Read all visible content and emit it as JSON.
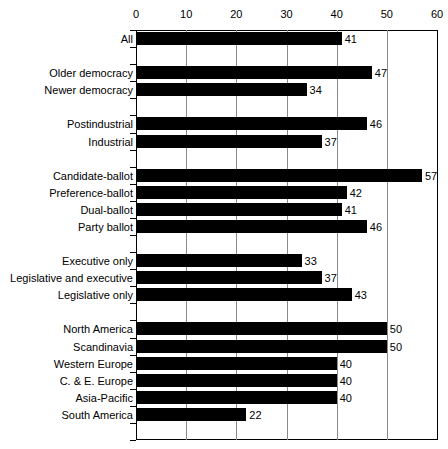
{
  "chart_data": {
    "type": "bar",
    "orientation": "horizontal",
    "title": "",
    "xlabel": "",
    "ylabel": "",
    "xlim": [
      0,
      60
    ],
    "xticks": [
      0,
      10,
      20,
      30,
      40,
      50,
      60
    ],
    "grid": true,
    "legend": false,
    "categories": [
      "All",
      "Older democracy",
      "Newer democracy",
      "Postindustrial",
      "Industrial",
      "Candidate-ballot",
      "Preference-ballot",
      "Dual-ballot",
      "Party ballot",
      "Executive only",
      "Legislative and executive",
      "Legislative only",
      "North America",
      "Scandinavia",
      "Western Europe",
      "C. & E. Europe",
      "Asia-Pacific",
      "South America"
    ],
    "values": [
      41,
      47,
      34,
      46,
      37,
      57,
      42,
      41,
      46,
      33,
      37,
      43,
      50,
      50,
      40,
      40,
      40,
      22
    ],
    "rows": [
      {
        "slot": 0,
        "label": "All",
        "value": 41
      },
      {
        "slot": 2,
        "label": "Older democracy",
        "value": 47
      },
      {
        "slot": 3,
        "label": "Newer democracy",
        "value": 34
      },
      {
        "slot": 5,
        "label": "Postindustrial",
        "value": 46
      },
      {
        "slot": 6,
        "label": "Industrial",
        "value": 37
      },
      {
        "slot": 8,
        "label": "Candidate-ballot",
        "value": 57
      },
      {
        "slot": 9,
        "label": "Preference-ballot",
        "value": 42
      },
      {
        "slot": 10,
        "label": "Dual-ballot",
        "value": 41
      },
      {
        "slot": 11,
        "label": "Party ballot",
        "value": 46
      },
      {
        "slot": 13,
        "label": "Executive only",
        "value": 33
      },
      {
        "slot": 14,
        "label": "Legislative and executive",
        "value": 37
      },
      {
        "slot": 15,
        "label": "Legislative only",
        "value": 43
      },
      {
        "slot": 17,
        "label": "North America",
        "value": 50
      },
      {
        "slot": 18,
        "label": "Scandinavia",
        "value": 50
      },
      {
        "slot": 19,
        "label": "Western Europe",
        "value": 40
      },
      {
        "slot": 20,
        "label": "C. & E. Europe",
        "value": 40
      },
      {
        "slot": 21,
        "label": "Asia-Pacific",
        "value": 40
      },
      {
        "slot": 22,
        "label": "South America",
        "value": 22
      }
    ],
    "total_slots": 24,
    "bar_color": "#000000",
    "gridline_color": "#8a8a8a",
    "axis_color": "#000000",
    "background_color": "#ffffff"
  }
}
